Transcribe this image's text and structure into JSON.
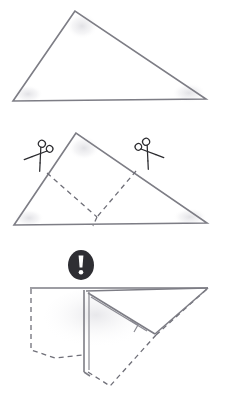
{
  "document": {
    "title": "Paper Folding Instruction Diagram",
    "kind": "origami-instruction-sequence",
    "step_count": 3,
    "background_color": "#ffffff",
    "line_color": "#7d7d85",
    "dashed_line_color": "#6f6f78",
    "icon_color": "#2e2e33"
  },
  "steps": [
    {
      "index": 1,
      "name": "plain-triangle",
      "label": "",
      "description": "Obtuse triangle sheet, apex near top center",
      "shape": "triangle",
      "line_style": "solid",
      "vertices": [
        [
          75,
          11
        ],
        [
          13,
          101
        ],
        [
          206,
          99
        ]
      ]
    },
    {
      "index": 2,
      "name": "triangle-with-cut-lines",
      "label": "",
      "description": "Same triangle with dashed cut lines and two scissors marks",
      "shape": "triangle",
      "line_style": "solid-with-dashed-cuts",
      "vertices": [
        [
          76,
          133
        ],
        [
          14,
          225
        ],
        [
          207,
          223
        ]
      ],
      "cut_lines": [
        [
          [
            47,
            173
          ],
          [
            97,
            217
          ]
        ],
        [
          [
            97,
            217
          ],
          [
            93,
            225
          ]
        ],
        [
          [
            136,
            171
          ],
          [
            97,
            217
          ]
        ]
      ],
      "scissors": [
        {
          "name": "scissors-left",
          "x": 38,
          "y": 157,
          "rotation_deg": 36,
          "mirrored": false
        },
        {
          "name": "scissors-right",
          "x": 150,
          "y": 155,
          "rotation_deg": -36,
          "mirrored": true
        }
      ]
    },
    {
      "index": 3,
      "name": "folded-result",
      "label": "",
      "description": "Resulting folded figure: solid visible flaps plus dashed hidden flaps, with warning icon above",
      "line_style": "solid-and-dashed",
      "solid_outline": [
        [
          30,
          288
        ],
        [
          208,
          288
        ],
        [
          155,
          334
        ],
        [
          86,
          291
        ]
      ],
      "center_fold": [
        [
          86,
          291
        ],
        [
          86,
          372
        ]
      ],
      "hidden_flaps": [
        {
          "name": "hidden-flap-left",
          "points": [
            [
              31,
              289
            ],
            [
              31,
              350
            ],
            [
              55,
              358
            ],
            [
              83,
              355
            ],
            [
              83,
              291
            ]
          ]
        },
        {
          "name": "hidden-flap-bottom",
          "points": [
            [
              88,
              372
            ],
            [
              110,
              385
            ],
            [
              155,
              334
            ],
            [
              207,
              289
            ]
          ]
        }
      ],
      "warning_icon": {
        "name": "exclamation-warning-icon",
        "glyph": "!",
        "cx": 81,
        "cy": 265,
        "rx": 13,
        "ry": 15,
        "disc_color": "#2e2e33",
        "glyph_color": "#ffffff"
      }
    }
  ],
  "legend": {
    "solid_line_meaning": "visible edge",
    "dashed_line_meaning": "hidden edge or cut line",
    "scissors_meaning": "cut here",
    "warning_meaning": "caution"
  }
}
